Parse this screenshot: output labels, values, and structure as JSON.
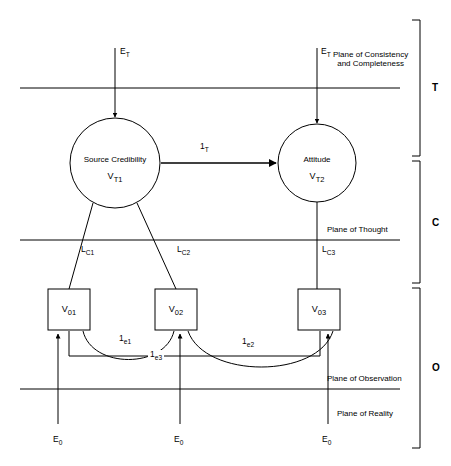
{
  "diagram": {
    "stroke_color": "#000000",
    "background_color": "#ffffff",
    "nodes": [
      {
        "id": "source-credibility",
        "shape": "circle",
        "name": "Source Credibility",
        "variable": "V",
        "variable_sub": "T1",
        "cx": 115,
        "cy": 163,
        "r": 45
      },
      {
        "id": "attitude",
        "shape": "circle",
        "name": "Attitude",
        "variable": "V",
        "variable_sub": "T2",
        "cx": 317,
        "cy": 163,
        "r": 39
      },
      {
        "id": "observed-1",
        "shape": "box",
        "variable": "V",
        "variable_sub": "01",
        "x": 48,
        "y": 289,
        "w": 42,
        "h": 41
      },
      {
        "id": "observed-2",
        "shape": "box",
        "variable": "V",
        "variable_sub": "02",
        "x": 155,
        "y": 289,
        "w": 42,
        "h": 41
      },
      {
        "id": "observed-3",
        "shape": "box",
        "variable": "V",
        "variable_sub": "03",
        "x": 298,
        "y": 289,
        "w": 42,
        "h": 41
      }
    ],
    "path_labels": [
      {
        "id": "structural-path-T",
        "base": "1",
        "sub": "T"
      },
      {
        "id": "loading-lc1",
        "base": "L",
        "sub": "C1"
      },
      {
        "id": "loading-lc2",
        "base": "L",
        "sub": "C2"
      },
      {
        "id": "loading-lc3",
        "base": "L",
        "sub": "C3"
      },
      {
        "id": "error-e1",
        "base": "1",
        "sub": "e1"
      },
      {
        "id": "error-e2",
        "base": "1",
        "sub": "e2"
      },
      {
        "id": "error-e3",
        "base": "1",
        "sub": "e3"
      }
    ],
    "exogenous_labels": [
      {
        "id": "et-left",
        "base": "E",
        "sub": "T"
      },
      {
        "id": "et-right",
        "base": "E",
        "sub": "T"
      },
      {
        "id": "e0-left",
        "base": "E",
        "sub": "0"
      },
      {
        "id": "e0-middle",
        "base": "E",
        "sub": "0"
      },
      {
        "id": "e0-right",
        "base": "E",
        "sub": "0"
      }
    ],
    "planes": [
      {
        "id": "plane-consistency",
        "line1": "Plane of Consistency",
        "line2": "and Completeness"
      },
      {
        "id": "plane-thought",
        "line1": "Plane of Thought"
      },
      {
        "id": "plane-observation",
        "line1": "Plane of Observation"
      },
      {
        "id": "plane-reality",
        "line1": "Plane of Reality"
      }
    ],
    "regions": [
      {
        "id": "region-theory",
        "label": "T"
      },
      {
        "id": "region-concept",
        "label": "C"
      },
      {
        "id": "region-observation",
        "label": "O"
      }
    ]
  }
}
